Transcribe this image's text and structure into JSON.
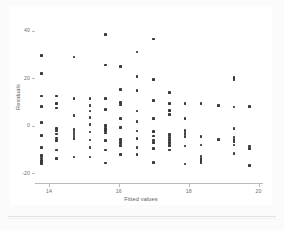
{
  "figure": {
    "background_color": "#fbfbfb",
    "card_color": "#ffffff",
    "point_color": "#3a3a3a",
    "axis_color": "#b9b9b9"
  },
  "chart_data": {
    "type": "scatter",
    "title": "",
    "subtitle": "",
    "xlabel": "Fitted values",
    "ylabel": "Residuals",
    "xlim": [
      13.6,
      20.1
    ],
    "ylim": [
      -24,
      42
    ],
    "xticks": [
      14,
      16,
      18,
      20
    ],
    "xticklabels": [
      "14",
      "16",
      "18",
      "20"
    ],
    "yticks": [
      40,
      20,
      0,
      -20
    ],
    "yticklabels": [
      "40",
      "20",
      "0",
      "-20"
    ],
    "grid": false,
    "legend": null,
    "marker": "square",
    "series": [
      {
        "name": "residuals",
        "points": [
          [
            13.78,
            29.5
          ],
          [
            13.78,
            22.0
          ],
          [
            13.78,
            12.6
          ],
          [
            13.78,
            8.2
          ],
          [
            13.78,
            1.5
          ],
          [
            13.78,
            -4.0
          ],
          [
            13.78,
            -9.0
          ],
          [
            13.78,
            -12.5
          ],
          [
            13.78,
            -13.5
          ],
          [
            13.78,
            -14.5
          ],
          [
            13.78,
            -15.3
          ],
          [
            13.78,
            -16.0
          ],
          [
            14.22,
            12.6
          ],
          [
            14.22,
            9.4
          ],
          [
            14.22,
            7.5
          ],
          [
            14.22,
            -1.0
          ],
          [
            14.22,
            -2.2
          ],
          [
            14.22,
            -3.4
          ],
          [
            14.22,
            -5.0
          ],
          [
            14.22,
            -6.2
          ],
          [
            14.22,
            -10.2
          ],
          [
            14.22,
            -13.6
          ],
          [
            14.72,
            29.0
          ],
          [
            14.72,
            11.6
          ],
          [
            14.72,
            4.4
          ],
          [
            14.72,
            -1.6
          ],
          [
            14.72,
            -2.6
          ],
          [
            14.72,
            -3.4
          ],
          [
            14.72,
            -4.2
          ],
          [
            14.72,
            -5.2
          ],
          [
            14.72,
            -13.0
          ],
          [
            15.18,
            11.6
          ],
          [
            15.18,
            8.6
          ],
          [
            15.18,
            6.2
          ],
          [
            15.18,
            3.6
          ],
          [
            15.18,
            0.6
          ],
          [
            15.18,
            -2.6
          ],
          [
            15.18,
            -6.0
          ],
          [
            15.18,
            -9.2
          ],
          [
            15.18,
            -13.0
          ],
          [
            15.62,
            38.5
          ],
          [
            15.62,
            25.6
          ],
          [
            15.62,
            11.4
          ],
          [
            15.62,
            6.8
          ],
          [
            15.62,
            0.2
          ],
          [
            15.62,
            -1.0
          ],
          [
            15.62,
            -2.0
          ],
          [
            15.62,
            -3.0
          ],
          [
            15.62,
            -6.2
          ],
          [
            15.62,
            -10.2
          ],
          [
            15.62,
            -15.6
          ],
          [
            16.05,
            25.0
          ],
          [
            16.05,
            15.2
          ],
          [
            16.05,
            9.8
          ],
          [
            16.05,
            8.8
          ],
          [
            16.05,
            3.0
          ],
          [
            16.05,
            -0.6
          ],
          [
            16.05,
            -5.6
          ],
          [
            16.05,
            -7.0
          ],
          [
            16.05,
            -8.2
          ],
          [
            16.05,
            -12.0
          ],
          [
            16.52,
            31.0
          ],
          [
            16.52,
            20.8
          ],
          [
            16.52,
            14.8
          ],
          [
            16.52,
            6.2
          ],
          [
            16.52,
            1.8
          ],
          [
            16.52,
            -2.2
          ],
          [
            16.52,
            -5.4
          ],
          [
            16.52,
            -9.0
          ],
          [
            16.52,
            -12.0
          ],
          [
            17.0,
            36.5
          ],
          [
            17.0,
            19.6
          ],
          [
            17.0,
            10.6
          ],
          [
            17.0,
            3.0
          ],
          [
            17.0,
            -2.4
          ],
          [
            17.0,
            -4.2
          ],
          [
            17.0,
            -6.0
          ],
          [
            17.0,
            -7.0
          ],
          [
            17.0,
            -9.6
          ],
          [
            17.0,
            -15.4
          ],
          [
            17.45,
            14.0
          ],
          [
            17.45,
            9.4
          ],
          [
            17.45,
            6.6
          ],
          [
            17.45,
            4.8
          ],
          [
            17.45,
            -3.6
          ],
          [
            17.45,
            -4.6
          ],
          [
            17.45,
            -5.6
          ],
          [
            17.45,
            -7.0
          ],
          [
            17.45,
            -8.2
          ],
          [
            17.45,
            -10.2
          ],
          [
            17.9,
            9.4
          ],
          [
            17.9,
            3.2
          ],
          [
            17.9,
            -2.0
          ],
          [
            17.9,
            -3.2
          ],
          [
            17.9,
            -4.4
          ],
          [
            17.9,
            -8.4
          ],
          [
            17.9,
            -16.0
          ],
          [
            18.35,
            9.4
          ],
          [
            18.35,
            -4.4
          ],
          [
            18.35,
            -8.0
          ],
          [
            18.35,
            -12.6
          ],
          [
            18.35,
            -13.6
          ],
          [
            18.35,
            -14.6
          ],
          [
            18.35,
            -15.4
          ],
          [
            18.85,
            8.6
          ],
          [
            18.85,
            -5.6
          ],
          [
            19.3,
            20.4
          ],
          [
            19.3,
            19.4
          ],
          [
            19.3,
            8.0
          ],
          [
            19.3,
            -1.2
          ],
          [
            19.3,
            -4.6
          ],
          [
            19.3,
            -5.6
          ],
          [
            19.3,
            -6.6
          ],
          [
            19.3,
            -8.0
          ],
          [
            19.3,
            -11.6
          ],
          [
            19.75,
            8.2
          ],
          [
            19.75,
            -8.4
          ],
          [
            19.75,
            -9.4
          ],
          [
            19.75,
            -16.6
          ]
        ]
      }
    ]
  }
}
